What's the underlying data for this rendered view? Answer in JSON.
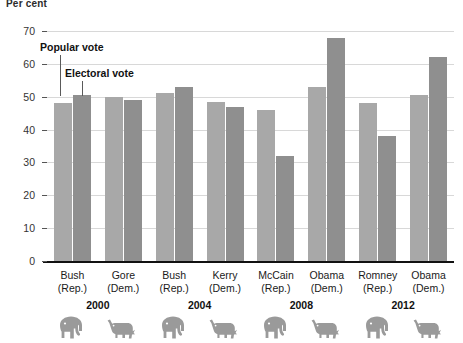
{
  "chart_data": {
    "type": "bar",
    "title": "Per cent",
    "xlabel": "",
    "ylabel": "Per cent",
    "ylim": [
      0,
      70
    ],
    "yticks": [
      0,
      10,
      20,
      30,
      40,
      50,
      60,
      70
    ],
    "grid": true,
    "legend_position": "inline-callout",
    "categories": [
      "Bush (Rep.)",
      "Gore (Dem.)",
      "Bush (Rep.)",
      "Kerry (Dem.)",
      "McCain (Rep.)",
      "Obama (Dem.)",
      "Romney (Rep.)",
      "Obama (Dem.)"
    ],
    "series": [
      {
        "name": "Popular vote",
        "values": [
          48,
          50,
          51,
          48.5,
          46,
          53,
          48,
          50.4
        ]
      },
      {
        "name": "Electoral vote",
        "values": [
          50.4,
          49,
          53,
          47,
          32,
          68,
          38,
          62
        ]
      }
    ],
    "annotations": [
      "Popular vote",
      "Electoral vote"
    ],
    "group_labels": [
      "2000",
      "2004",
      "2008",
      "2012"
    ]
  },
  "axis": {
    "title": "Per cent",
    "ticks": [
      "70",
      "60",
      "50",
      "40",
      "30",
      "20",
      "10",
      "0"
    ]
  },
  "callouts": {
    "popular": "Popular vote",
    "electoral": "Electoral vote"
  },
  "candidates": [
    {
      "name": "Bush",
      "party": "(Rep.)",
      "party_icon": "elephant-icon",
      "popular": 48,
      "electoral": 50.4
    },
    {
      "name": "Gore",
      "party": "(Dem.)",
      "party_icon": "donkey-icon",
      "popular": 50,
      "electoral": 49
    },
    {
      "name": "Bush",
      "party": "(Rep.)",
      "party_icon": "elephant-icon",
      "popular": 51,
      "electoral": 53
    },
    {
      "name": "Kerry",
      "party": "(Dem.)",
      "party_icon": "donkey-icon",
      "popular": 48.5,
      "electoral": 47
    },
    {
      "name": "McCain",
      "party": "(Rep.)",
      "party_icon": "elephant-icon",
      "popular": 46,
      "electoral": 32
    },
    {
      "name": "Obama",
      "party": "(Dem.)",
      "party_icon": "donkey-icon",
      "popular": 53,
      "electoral": 68
    },
    {
      "name": "Romney",
      "party": "(Rep.)",
      "party_icon": "elephant-icon",
      "popular": 48,
      "electoral": 38
    },
    {
      "name": "Obama",
      "party": "(Dem.)",
      "party_icon": "donkey-icon",
      "popular": 50.4,
      "electoral": 62
    }
  ],
  "years": [
    "2000",
    "2004",
    "2008",
    "2012"
  ],
  "colors": {
    "popular_bar": "#a8a8a8",
    "electoral_bar": "#8f8f8f",
    "gridline": "#d8d8d8",
    "baseline": "#111111",
    "animal": "#9a9a9a"
  }
}
